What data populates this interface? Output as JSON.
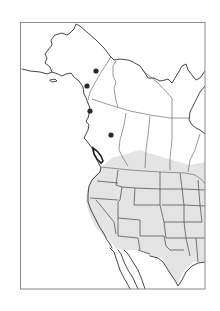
{
  "map": {
    "type": "species-range-map",
    "region": "Western and central North America",
    "frame": {
      "x": 20,
      "y": 22,
      "width": 185,
      "height": 267,
      "stroke": "#8a8a8a"
    },
    "colors": {
      "background": "#ffffff",
      "coastline": "#333333",
      "borders": "#555555",
      "range_shading": "#e4e4e4",
      "locality_dot": "#2a2a2a"
    },
    "range": {
      "description": "Shaded range covering the contiguous western/central United States and southern Canadian prairies",
      "fill": "#e4e4e4"
    },
    "localities": [
      {
        "label": "locality-1",
        "x": 96,
        "y": 71
      },
      {
        "label": "locality-2",
        "x": 87,
        "y": 86
      },
      {
        "label": "locality-3",
        "x": 90,
        "y": 111
      },
      {
        "label": "locality-4",
        "x": 111,
        "y": 135
      }
    ],
    "highlighted_feature": "Vancouver Island outline (bold)"
  }
}
